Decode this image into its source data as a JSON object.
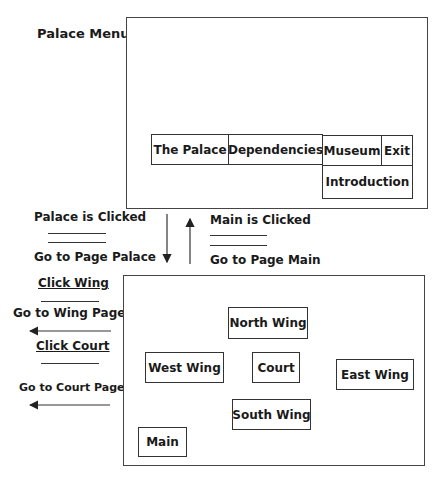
{
  "top_screen": {
    "title": "Palace Menu",
    "menu": [
      {
        "label": "The Palace"
      },
      {
        "label": "Dependencies"
      },
      {
        "label": "Museum"
      },
      {
        "label": "Exit"
      },
      {
        "label": "Introduction"
      }
    ]
  },
  "transitions": {
    "down": {
      "event": "Palace is Clicked",
      "action": "Go to Page Palace"
    },
    "up": {
      "event": "Main is Clicked",
      "action": "Go to Page Main"
    },
    "wing": {
      "event": "Click Wing",
      "action": "Go to Wing Page"
    },
    "court": {
      "event": "Click Court",
      "action": "Go to Court Page"
    }
  },
  "bottom_screen": {
    "buttons": [
      {
        "label": "North Wing"
      },
      {
        "label": "West Wing"
      },
      {
        "label": "Court"
      },
      {
        "label": "East Wing"
      },
      {
        "label": "South Wing"
      },
      {
        "label": "Main"
      }
    ]
  }
}
